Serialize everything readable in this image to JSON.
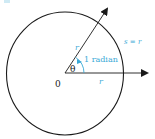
{
  "diagram": {
    "colors": {
      "stroke": "#1a1a1a",
      "accent": "#3aa9d6"
    },
    "labels": {
      "origin": "0",
      "theta": "θ",
      "radius_upper": "r",
      "radius_lower": "r",
      "angle_label": "1 radian",
      "arc_label": "s = r"
    },
    "elements": {
      "circle": {
        "cx": 65,
        "cy": 73,
        "r": 60
      },
      "ray_horizontal": {
        "from": [
          65,
          73
        ],
        "to": [
          148,
          73
        ]
      },
      "ray_angled": {
        "from": [
          65,
          73
        ],
        "to": [
          108,
          8
        ]
      }
    }
  }
}
